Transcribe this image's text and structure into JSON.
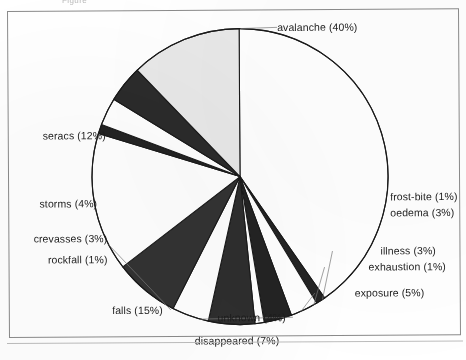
{
  "figure": {
    "cropped_caption": "Figure",
    "frame": {
      "border_color": "#8b8b8b"
    }
  },
  "chart_data": {
    "type": "pie",
    "title": "",
    "xlabel": "",
    "ylabel": "",
    "legend_position": "none",
    "grid": false,
    "units": "percent",
    "start_angle_deg": 0,
    "direction": "clockwise",
    "total": 99,
    "categories": [
      "avalanche",
      "frost-bite",
      "oedema",
      "illness",
      "exhaustion",
      "exposure",
      "unknown",
      "disappeared",
      "falls",
      "rockfall",
      "crevasses",
      "storms",
      "seracs"
    ],
    "values": [
      40,
      1,
      3,
      3,
      1,
      5,
      4,
      7,
      15,
      1,
      3,
      4,
      12
    ],
    "labels": [
      "avalanche (40%)",
      "frost-bite (1%)",
      "oedema (3%)",
      "illness (3%)",
      "exhaustion (1%)",
      "exposure (5%)",
      "unknown (4%)",
      "disappeared (7%)",
      "falls (15%)",
      "rockfall (1%)",
      "crevasses (3%)",
      "storms (4%)",
      "seracs (12%)"
    ],
    "slice_colors": [
      "#ffffff",
      "#232323",
      "#ffffff",
      "#232323",
      "#ffffff",
      "#2e2e2e",
      "#ffffff",
      "#333333",
      "#ffffff",
      "#232323",
      "#ffffff",
      "#2b2b2b",
      "#e9e9e9"
    ],
    "outline_color": "#1a1a1a",
    "center": {
      "x": 238,
      "y": 176
    },
    "radius": 148
  },
  "labels": {
    "avalanche": {
      "text": "avalanche (40%)",
      "x": 276,
      "y": 28,
      "align": "r"
    },
    "frost_bite": {
      "text": "frost-bite (1%)",
      "x": 388,
      "y": 198,
      "align": "r"
    },
    "oedema": {
      "text": "oedema (3%)",
      "x": 388,
      "y": 214,
      "align": "r"
    },
    "illness": {
      "text": "illness (3%)",
      "x": 378,
      "y": 252,
      "align": "r"
    },
    "exhaustion": {
      "text": "exhaustion (1%)",
      "x": 366,
      "y": 268,
      "align": "r"
    },
    "exposure": {
      "text": "exposure (5%)",
      "x": 352,
      "y": 294,
      "align": "r"
    },
    "unknown": {
      "text": "unknown (4%)",
      "x": 283,
      "y": 318,
      "align": "l"
    },
    "disappeared": {
      "text": "disappeared (7%)",
      "x": 234,
      "y": 341,
      "align": "c"
    },
    "falls": {
      "text": "falls (15%)",
      "x": 160,
      "y": 310,
      "align": "l"
    },
    "rockfall": {
      "text": "rockfall (1%)",
      "x": 105,
      "y": 259,
      "align": "l"
    },
    "crevasses": {
      "text": "crevasses (3%)",
      "x": 105,
      "y": 238,
      "align": "l"
    },
    "storms": {
      "text": "storms (4%)",
      "x": 95,
      "y": 203,
      "align": "l"
    },
    "seracs": {
      "text": "seracs (12%)",
      "x": 104,
      "y": 135,
      "align": "l"
    }
  }
}
